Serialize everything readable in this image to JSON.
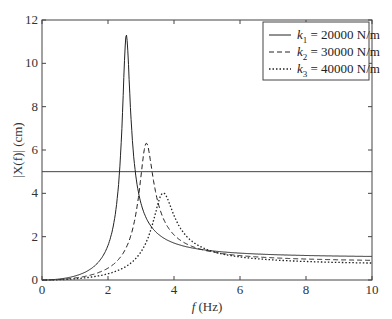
{
  "chart_data": {
    "type": "line",
    "title": "",
    "xlabel": "f (Hz)",
    "ylabel": "|X(f)| (cm)",
    "xlim": [
      0,
      10
    ],
    "ylim": [
      0,
      12
    ],
    "xticks": [
      "0",
      "2",
      "4",
      "6",
      "8",
      "10"
    ],
    "yticks": [
      "0",
      "2",
      "4",
      "6",
      "8",
      "10",
      "12"
    ],
    "grid": false,
    "legend_position": "upper right",
    "reference_line": {
      "orientation": "horizontal",
      "y": 5
    },
    "series": [
      {
        "name": "k1 = 20000 N/m",
        "style": "solid",
        "peak_f": 2.55,
        "peak_value": 11.3,
        "x": [
          0,
          0.5,
          1.0,
          1.5,
          2.0,
          2.3,
          2.45,
          2.55,
          2.65,
          2.8,
          3.0,
          3.5,
          4.0,
          5.0,
          6.0,
          8.0,
          10.0
        ],
        "y": [
          0,
          0.8,
          1.3,
          1.7,
          2.5,
          4.2,
          7.0,
          11.3,
          7.0,
          4.0,
          2.2,
          0.8,
          0.4,
          0.15,
          0.05,
          0.02,
          0.01
        ]
      },
      {
        "name": "k2 = 30000 N/m",
        "style": "dashed",
        "peak_f": 3.15,
        "peak_value": 6.3,
        "x": [
          0,
          0.5,
          1.0,
          1.5,
          2.0,
          2.5,
          2.8,
          3.0,
          3.15,
          3.3,
          3.5,
          4.0,
          4.5,
          5.0,
          6.0,
          8.0,
          10.0
        ],
        "y": [
          0,
          0.6,
          0.9,
          1.1,
          1.4,
          2.0,
          3.0,
          4.5,
          6.3,
          4.3,
          2.3,
          0.7,
          0.3,
          0.15,
          0.05,
          0.02,
          0.01
        ]
      },
      {
        "name": "k3 = 40000 N/m",
        "style": "dotted",
        "peak_f": 3.65,
        "peak_value": 4.0,
        "x": [
          0,
          0.5,
          1.0,
          1.5,
          2.0,
          2.5,
          3.0,
          3.3,
          3.5,
          3.65,
          3.8,
          4.0,
          4.5,
          5.0,
          6.0,
          8.0,
          10.0
        ],
        "y": [
          0,
          0.5,
          0.65,
          0.7,
          0.8,
          0.9,
          1.2,
          1.8,
          2.8,
          4.0,
          3.0,
          1.8,
          0.6,
          0.25,
          0.07,
          0.02,
          0.01
        ]
      }
    ]
  },
  "legend": {
    "items": [
      {
        "sym": "k",
        "sub": "1",
        "text": " = 20000 N/m"
      },
      {
        "sym": "k",
        "sub": "2",
        "text": " = 30000 N/m"
      },
      {
        "sym": "k",
        "sub": "3",
        "text": " = 40000 N/m"
      }
    ]
  },
  "axes": {
    "xlabel_italic": "f",
    "xlabel_unit": " (Hz)",
    "ylabel": "|X(f)| (cm)"
  }
}
